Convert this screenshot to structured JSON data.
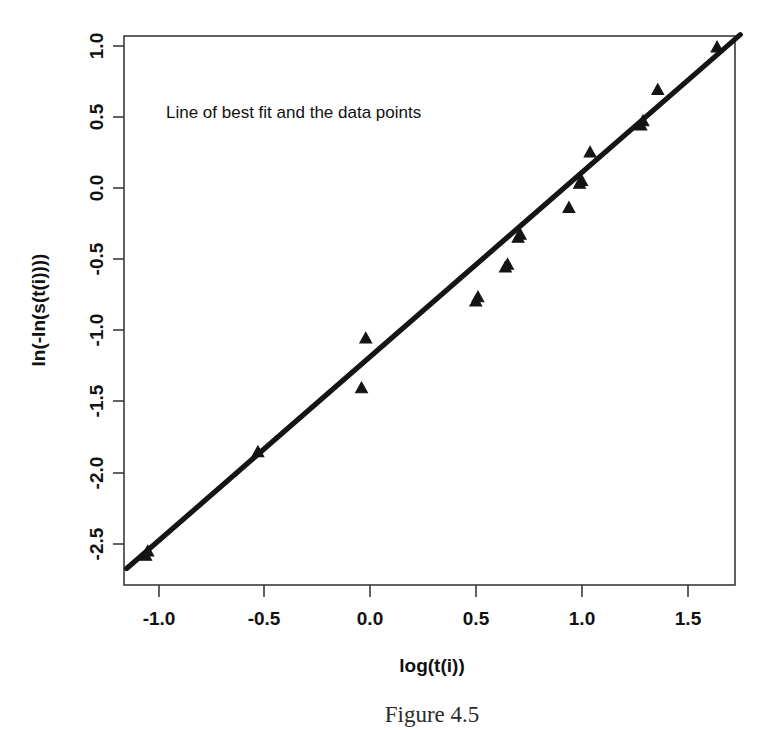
{
  "figure": {
    "caption": "Figure 4.5",
    "annotation": "Line of best fit and the data points"
  },
  "chart_data": {
    "type": "scatter",
    "title": "",
    "annotation": "Line of best fit and the data points",
    "xlabel": "log(t(i))",
    "ylabel": "ln(-ln(s(t(i))))",
    "xlim": [
      -1.15,
      1.75
    ],
    "ylim": [
      -2.68,
      1.08
    ],
    "xticks": [
      -1.0,
      -0.5,
      0.0,
      0.5,
      1.0,
      1.5
    ],
    "xtick_labels": [
      "-1.0",
      "-0.5",
      "0.0",
      "0.5",
      "1.0",
      "1.5"
    ],
    "yticks": [
      -2.5,
      -2.0,
      -1.5,
      -1.0,
      -0.5,
      0.0,
      0.5,
      1.0
    ],
    "ytick_labels": [
      "-2.5",
      "-2.0",
      "-1.5",
      "-1.0",
      "-0.5",
      "0.0",
      "0.5",
      "1.0"
    ],
    "grid": false,
    "legend": "none",
    "marker": "triangle",
    "marker_color": "#141414",
    "line_color": "#151515",
    "series": [
      {
        "name": "data points",
        "type": "scatter",
        "points": [
          {
            "x": -1.06,
            "y": -2.59
          },
          {
            "x": -1.05,
            "y": -2.56
          },
          {
            "x": -0.53,
            "y": -1.86
          },
          {
            "x": -0.04,
            "y": -1.41
          },
          {
            "x": -0.02,
            "y": -1.06
          },
          {
            "x": 0.5,
            "y": -0.8
          },
          {
            "x": 0.51,
            "y": -0.77
          },
          {
            "x": 0.64,
            "y": -0.56
          },
          {
            "x": 0.65,
            "y": -0.54
          },
          {
            "x": 0.7,
            "y": -0.35
          },
          {
            "x": 0.71,
            "y": -0.33
          },
          {
            "x": 0.94,
            "y": -0.14
          },
          {
            "x": 0.99,
            "y": 0.03
          },
          {
            "x": 1.0,
            "y": 0.05
          },
          {
            "x": 1.04,
            "y": 0.25
          },
          {
            "x": 1.28,
            "y": 0.44
          },
          {
            "x": 1.29,
            "y": 0.47
          },
          {
            "x": 1.36,
            "y": 0.69
          },
          {
            "x": 1.64,
            "y": 0.99
          }
        ]
      },
      {
        "name": "line of best fit",
        "type": "line",
        "endpoints": [
          {
            "x": -1.15,
            "y": -2.68
          },
          {
            "x": 1.75,
            "y": 1.08
          }
        ],
        "slope": 1.297,
        "intercept": -1.189
      }
    ]
  }
}
